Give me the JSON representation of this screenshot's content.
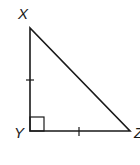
{
  "diagram": {
    "type": "right-triangle",
    "vertices": [
      {
        "label": "X",
        "x": 30,
        "y": 28
      },
      {
        "label": "Y",
        "x": 30,
        "y": 131
      },
      {
        "label": "Z",
        "x": 130,
        "y": 131
      }
    ],
    "right_angle_at": "Y",
    "congruent_sides": [
      "XY",
      "YZ"
    ],
    "stroke_color": "#1a1a1a",
    "background": "#ffffff"
  },
  "labels": {
    "x": "X",
    "y": "Y",
    "z": "Z"
  }
}
